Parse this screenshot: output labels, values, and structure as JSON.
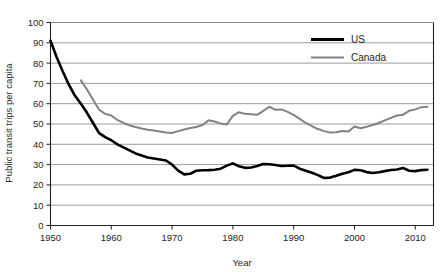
{
  "chart_data": {
    "type": "line",
    "title": "",
    "xlabel": "Year",
    "ylabel": "Public transit trips per capita",
    "xlim": [
      1950,
      2013
    ],
    "ylim": [
      0,
      100
    ],
    "grid": true,
    "legend_position": "top-right",
    "x_ticks": [
      "1950",
      "1960",
      "1970",
      "1980",
      "1990",
      "2000",
      "2010"
    ],
    "x_tick_values": [
      1950,
      1960,
      1970,
      1980,
      1990,
      2000,
      2010
    ],
    "y_ticks": [
      "0",
      "10",
      "20",
      "30",
      "40",
      "50",
      "60",
      "70",
      "80",
      "90",
      "100"
    ],
    "y_tick_values": [
      0,
      10,
      20,
      30,
      40,
      50,
      60,
      70,
      80,
      90,
      100
    ],
    "series": [
      {
        "name": "US",
        "color": "#000000",
        "width": 2.6,
        "x": [
          1950,
          1951,
          1952,
          1953,
          1954,
          1955,
          1956,
          1957,
          1958,
          1959,
          1960,
          1961,
          1962,
          1963,
          1964,
          1965,
          1966,
          1967,
          1968,
          1969,
          1970,
          1971,
          1972,
          1973,
          1974,
          1975,
          1976,
          1977,
          1978,
          1979,
          1980,
          1981,
          1982,
          1983,
          1984,
          1985,
          1986,
          1987,
          1988,
          1989,
          1990,
          1991,
          1992,
          1993,
          1994,
          1995,
          1996,
          1997,
          1998,
          1999,
          2000,
          2001,
          2002,
          2003,
          2004,
          2005,
          2006,
          2007,
          2008,
          2009,
          2010,
          2011,
          2012
        ],
        "values": [
          91.0,
          83.0,
          76.0,
          69.5,
          64.0,
          60.0,
          55.5,
          50.5,
          45.5,
          43.5,
          42.0,
          40.0,
          38.5,
          37.0,
          35.5,
          34.5,
          33.5,
          33.0,
          32.5,
          32.0,
          30.0,
          27.0,
          25.2,
          25.5,
          27.0,
          27.2,
          27.3,
          27.5,
          28.0,
          29.5,
          30.6,
          29.2,
          28.4,
          28.6,
          29.3,
          30.3,
          30.2,
          29.8,
          29.3,
          29.4,
          29.5,
          28.0,
          27.0,
          26.0,
          24.8,
          23.4,
          23.6,
          24.5,
          25.5,
          26.2,
          27.4,
          27.2,
          26.3,
          25.9,
          26.2,
          26.8,
          27.3,
          27.6,
          28.3,
          27.0,
          26.8,
          27.3,
          27.5
        ]
      },
      {
        "name": "Canada",
        "color": "#808285",
        "width": 2.0,
        "x": [
          1955,
          1956,
          1957,
          1958,
          1959,
          1960,
          1961,
          1962,
          1963,
          1964,
          1965,
          1966,
          1967,
          1968,
          1969,
          1970,
          1971,
          1972,
          1973,
          1974,
          1975,
          1976,
          1977,
          1978,
          1979,
          1980,
          1981,
          1982,
          1983,
          1984,
          1985,
          1986,
          1987,
          1988,
          1989,
          1990,
          1991,
          1992,
          1993,
          1994,
          1995,
          1996,
          1997,
          1998,
          1999,
          2000,
          2001,
          2002,
          2003,
          2004,
          2005,
          2006,
          2007,
          2008,
          2009,
          2010,
          2011,
          2012
        ],
        "values": [
          71.5,
          67.0,
          62.0,
          57.0,
          55.0,
          54.2,
          52.0,
          50.5,
          49.3,
          48.5,
          47.8,
          47.2,
          46.8,
          46.3,
          45.8,
          45.6,
          46.5,
          47.3,
          48.0,
          48.5,
          49.5,
          51.8,
          51.2,
          50.2,
          49.8,
          54.0,
          55.8,
          55.0,
          54.8,
          54.5,
          56.5,
          58.5,
          57.0,
          57.2,
          56.0,
          54.5,
          52.5,
          50.5,
          49.0,
          47.5,
          46.5,
          45.8,
          45.9,
          46.5,
          46.3,
          48.8,
          47.9,
          48.6,
          49.5,
          50.5,
          51.8,
          53.0,
          54.2,
          54.6,
          56.5,
          57.2,
          58.3,
          58.5
        ]
      }
    ]
  },
  "legend": {
    "items": [
      {
        "label": "US",
        "color": "#000000"
      },
      {
        "label": "Canada",
        "color": "#808285"
      }
    ]
  }
}
